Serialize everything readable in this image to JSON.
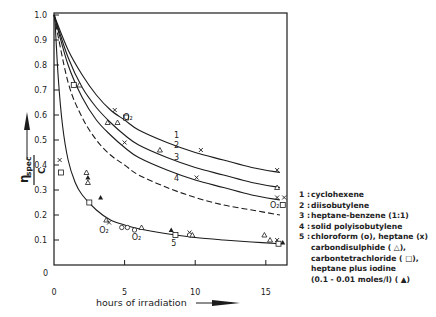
{
  "chart_data": {
    "type": "line",
    "title": "",
    "xlabel": "hours of irradiation",
    "ylabel": "η_spec / C",
    "xlim": [
      0,
      16.5
    ],
    "ylim": [
      0,
      1.0
    ],
    "x_ticks": [
      0,
      5,
      10,
      15
    ],
    "y_ticks": [
      0,
      0.1,
      0.2,
      0.3,
      0.4,
      0.5,
      0.6,
      0.7,
      0.8,
      0.9,
      1.0
    ],
    "x_tick_labels": [
      "0",
      "5",
      "10",
      "15"
    ],
    "y_tick_labels": [
      "0",
      "0.1",
      "0.2",
      "0.3",
      "0.4",
      "0.5",
      "0.6",
      "0.7",
      "0.8",
      "0.9",
      "1.0"
    ],
    "grid": false,
    "legend_position": "right",
    "series": [
      {
        "name": "1 : cyclohexene",
        "label": "1",
        "style": "solid",
        "x": [
          0,
          1,
          2,
          3,
          4,
          5,
          6,
          8,
          10,
          12,
          14,
          16
        ],
        "y": [
          1.0,
          0.86,
          0.76,
          0.68,
          0.62,
          0.58,
          0.54,
          0.49,
          0.45,
          0.42,
          0.39,
          0.37
        ],
        "markers": [
          {
            "x": 4.3,
            "y": 0.62,
            "m": "x"
          },
          {
            "x": 10.4,
            "y": 0.46,
            "m": "x"
          },
          {
            "x": 15.8,
            "y": 0.38,
            "m": "x"
          }
        ]
      },
      {
        "name": "2 : diisobutylene",
        "label": "2",
        "style": "solid",
        "x": [
          0,
          1,
          2,
          3,
          4,
          5,
          6,
          8,
          10,
          12,
          14,
          16
        ],
        "y": [
          1.0,
          0.83,
          0.71,
          0.63,
          0.57,
          0.52,
          0.48,
          0.43,
          0.39,
          0.36,
          0.33,
          0.31
        ],
        "markers": [
          {
            "x": 1.8,
            "y": 0.72,
            "m": "triangle"
          },
          {
            "x": 3.8,
            "y": 0.57,
            "m": "triangle"
          },
          {
            "x": 4.5,
            "y": 0.57,
            "m": "triangle"
          },
          {
            "x": 7.5,
            "y": 0.46,
            "m": "triangle"
          },
          {
            "x": 15.8,
            "y": 0.31,
            "m": "triangle"
          }
        ]
      },
      {
        "name": "3 : heptane-benzene (1:1)",
        "label": "3",
        "style": "solid",
        "x": [
          0,
          1,
          2,
          3,
          4,
          5,
          6,
          8,
          10,
          12,
          14,
          16
        ],
        "y": [
          1.0,
          0.8,
          0.67,
          0.58,
          0.52,
          0.47,
          0.43,
          0.38,
          0.34,
          0.31,
          0.28,
          0.26
        ],
        "markers": [
          {
            "x": 5.0,
            "y": 0.49,
            "m": "x"
          },
          {
            "x": 10.1,
            "y": 0.35,
            "m": "x"
          },
          {
            "x": 15.8,
            "y": 0.27,
            "m": "x"
          },
          {
            "x": 16.3,
            "y": 0.27,
            "m": "x"
          }
        ]
      },
      {
        "name": "4 : solid polyisobutylene",
        "label": "4",
        "style": "dashed",
        "x": [
          0,
          1,
          2,
          3,
          4,
          5,
          6,
          8,
          10,
          12,
          14,
          16
        ],
        "y": [
          1.0,
          0.73,
          0.59,
          0.5,
          0.44,
          0.4,
          0.36,
          0.31,
          0.27,
          0.24,
          0.22,
          0.2
        ],
        "markers": [
          {
            "x": 1.4,
            "y": 0.72,
            "m": "square"
          },
          {
            "x": 5.1,
            "y": 0.59,
            "m": "square"
          },
          {
            "x": 16.2,
            "y": 0.24,
            "m": "square"
          }
        ]
      },
      {
        "name": "5 : chloroform (o), heptane (x), carbondisulphide (△), carbontetrachloride (□), heptane plus iodine (0.1-0.01 moles/l) (▲)",
        "label": "5",
        "style": "solid",
        "x": [
          0.05,
          0.3,
          0.6,
          1,
          1.5,
          2,
          3,
          4,
          5,
          6,
          8,
          10,
          12,
          14,
          16
        ],
        "y": [
          1.0,
          0.75,
          0.56,
          0.42,
          0.33,
          0.28,
          0.22,
          0.18,
          0.16,
          0.145,
          0.125,
          0.11,
          0.1,
          0.092,
          0.085
        ],
        "markers": [
          {
            "x": 0.4,
            "y": 0.42,
            "m": "x"
          },
          {
            "x": 0.5,
            "y": 0.37,
            "m": "square"
          },
          {
            "x": 2.3,
            "y": 0.37,
            "m": "triangle"
          },
          {
            "x": 2.4,
            "y": 0.33,
            "m": "triangle"
          },
          {
            "x": 2.4,
            "y": 0.35,
            "m": "filled-triangle"
          },
          {
            "x": 2.5,
            "y": 0.25,
            "m": "square"
          },
          {
            "x": 3.3,
            "y": 0.27,
            "m": "filled-triangle"
          },
          {
            "x": 3.7,
            "y": 0.18,
            "m": "triangle"
          },
          {
            "x": 3.9,
            "y": 0.17,
            "m": "x"
          },
          {
            "x": 5.2,
            "y": 0.15,
            "m": "circle"
          },
          {
            "x": 5.7,
            "y": 0.14,
            "m": "circle"
          },
          {
            "x": 4.8,
            "y": 0.15,
            "m": "circle"
          },
          {
            "x": 6.2,
            "y": 0.15,
            "m": "triangle"
          },
          {
            "x": 8.3,
            "y": 0.14,
            "m": "filled-triangle"
          },
          {
            "x": 8.6,
            "y": 0.12,
            "m": "square"
          },
          {
            "x": 9.6,
            "y": 0.13,
            "m": "x"
          },
          {
            "x": 9.6,
            "y": 0.12,
            "m": "circle"
          },
          {
            "x": 9.8,
            "y": 0.12,
            "m": "triangle"
          },
          {
            "x": 14.9,
            "y": 0.12,
            "m": "triangle"
          },
          {
            "x": 15.3,
            "y": 0.1,
            "m": "triangle"
          },
          {
            "x": 15.8,
            "y": 0.1,
            "m": "x"
          },
          {
            "x": 15.9,
            "y": 0.085,
            "m": "square"
          },
          {
            "x": 16.2,
            "y": 0.09,
            "m": "filled-triangle"
          }
        ]
      }
    ],
    "annotations": [
      {
        "text": "O₂",
        "x": 4.9,
        "y": 0.58
      },
      {
        "text": "O₂",
        "x": 3.2,
        "y": 0.13
      },
      {
        "text": "O₂",
        "x": 5.5,
        "y": 0.1
      },
      {
        "text": "O₂",
        "x": 15.3,
        "y": 0.23
      }
    ]
  },
  "axes": {
    "x_label": "hours of irradiation",
    "y_label_num": "η",
    "y_label_sub": "spec",
    "y_label_den": "C"
  },
  "legend": {
    "items": [
      {
        "num": "1 :",
        "text": "cyclohexene"
      },
      {
        "num": "2 :",
        "text": "diisobutylene"
      },
      {
        "num": "3 :",
        "text": "heptane-benzene (1:1)"
      },
      {
        "num": "4 :",
        "text": "solid  polyisobutylene"
      },
      {
        "num": "5 :",
        "text": "chloroform (o),  heptane (x)"
      }
    ],
    "continuation": [
      "carbondisulphide ( △),",
      "carbontetrachloride ( □),",
      "heptane  plus  iodine",
      "(0.1 - 0.01  moles/l) ( ▲)"
    ]
  },
  "curve_labels": [
    "1",
    "2",
    "3",
    "4",
    "5"
  ]
}
